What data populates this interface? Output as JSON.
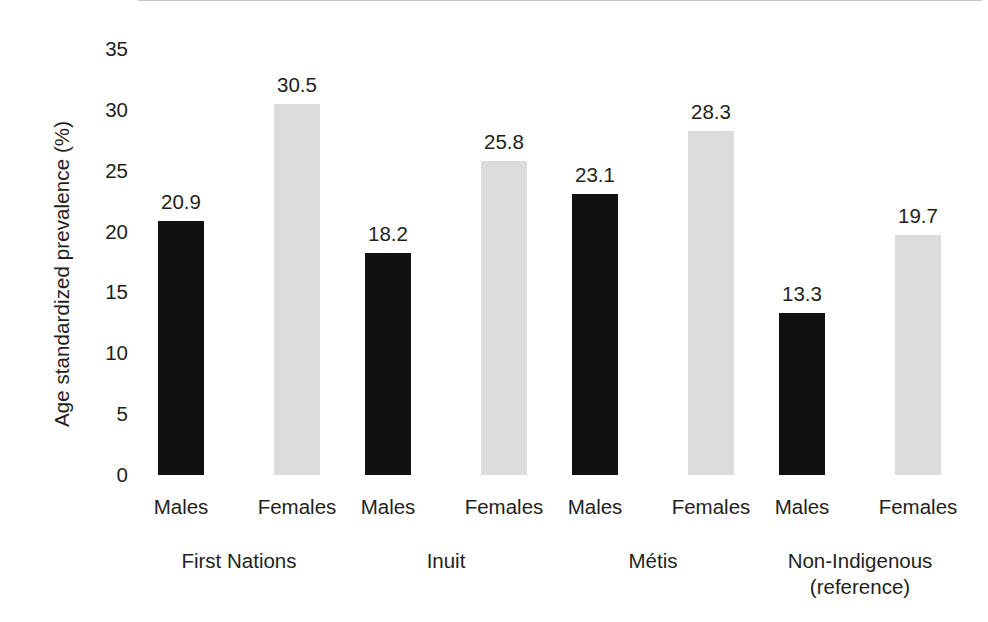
{
  "chart_data": {
    "type": "bar",
    "title": "",
    "subtitle": "",
    "xlabel": "",
    "ylabel": "Age standardized prevalence (%)",
    "ylim": [
      0,
      35
    ],
    "ytick_step": 5,
    "yticks": [
      "35",
      "30",
      "25",
      "20",
      "15",
      "10",
      "5",
      "0"
    ],
    "grid": false,
    "legend": null,
    "categories": [
      "First Nations",
      "Inuit",
      "Métis",
      "Non-Indigenous (reference)"
    ],
    "subcategories": [
      "Males",
      "Females"
    ],
    "series": [
      {
        "name": "Males",
        "color": "#111111",
        "values": [
          20.9,
          18.2,
          23.1,
          13.3
        ]
      },
      {
        "name": "Females",
        "color": "#dcdcdc",
        "values": [
          30.5,
          25.8,
          28.3,
          19.7
        ]
      }
    ],
    "bars": [
      {
        "group": "First Nations",
        "sex": "Males",
        "value": 20.9,
        "label": "20.9",
        "series": "male"
      },
      {
        "group": "First Nations",
        "sex": "Females",
        "value": 30.5,
        "label": "30.5",
        "series": "female"
      },
      {
        "group": "Inuit",
        "sex": "Males",
        "value": 18.2,
        "label": "18.2",
        "series": "male"
      },
      {
        "group": "Inuit",
        "sex": "Females",
        "value": 25.8,
        "label": "25.8",
        "series": "female"
      },
      {
        "group": "Métis",
        "sex": "Males",
        "value": 23.1,
        "label": "23.1",
        "series": "male"
      },
      {
        "group": "Métis",
        "sex": "Females",
        "value": 28.3,
        "label": "28.3",
        "series": "female"
      },
      {
        "group": "Non-Indigenous (reference)",
        "sex": "Males",
        "value": 13.3,
        "label": "13.3",
        "series": "male"
      },
      {
        "group": "Non-Indigenous (reference)",
        "sex": "Females",
        "value": 19.7,
        "label": "19.7",
        "series": "female"
      }
    ],
    "group_labels": [
      {
        "line1": "First Nations",
        "line2": ""
      },
      {
        "line1": "Inuit",
        "line2": ""
      },
      {
        "line1": "Métis",
        "line2": ""
      },
      {
        "line1": "Non-Indigenous",
        "line2": "(reference)"
      }
    ],
    "sex_labels": [
      "Males",
      "Females",
      "Males",
      "Females",
      "Males",
      "Females",
      "Males",
      "Females"
    ],
    "colors": {
      "male_bar": "#111111",
      "female_bar": "#dcdcdc",
      "text": "#231f20",
      "background": "#ffffff",
      "baseline": "#c9c9c9"
    }
  }
}
